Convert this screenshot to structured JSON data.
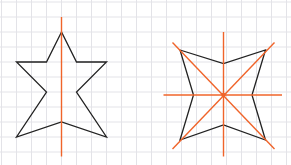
{
  "diagram": {
    "grid_color": "#e3e3e8",
    "shape_color": "#222222",
    "axis_color": "#f0642a",
    "figures": [
      {
        "name": "five-pointed-star",
        "symmetry_lines": 1,
        "vertices_grid": [
          [
            4,
            2
          ],
          [
            3,
            4
          ],
          [
            1,
            4
          ],
          [
            3,
            6
          ],
          [
            1,
            9
          ],
          [
            4,
            8
          ],
          [
            7,
            9
          ],
          [
            5,
            6
          ],
          [
            7,
            4
          ],
          [
            5,
            4
          ]
        ],
        "axes_grid": [
          [
            [
              4,
              1
            ],
            [
              4,
              10.3
            ]
          ]
        ]
      },
      {
        "name": "four-pointed-star",
        "symmetry_lines": 4,
        "vertices_grid": [
          [
            11.9,
            3.2
          ],
          [
            14.8,
            4.1
          ],
          [
            17.6,
            3.2
          ],
          [
            16.7,
            6.2
          ],
          [
            17.6,
            9.2
          ],
          [
            14.8,
            8.2
          ],
          [
            11.9,
            9.2
          ],
          [
            12.8,
            6.2
          ]
        ],
        "axes_grid": [
          [
            [
              14.8,
              2
            ],
            [
              14.8,
              10.3
            ]
          ],
          [
            [
              10.8,
              6.2
            ],
            [
              18.7,
              6.2
            ]
          ],
          [
            [
              11.4,
              2.7
            ],
            [
              18.2,
              9.8
            ]
          ],
          [
            [
              18.2,
              2.7
            ],
            [
              11.4,
              9.8
            ]
          ]
        ]
      }
    ]
  }
}
